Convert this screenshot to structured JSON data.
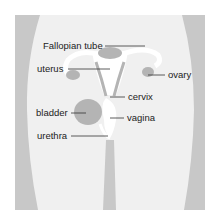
{
  "diagram": {
    "labels": [
      {
        "id": "fallopian_tube",
        "text": "Fallopian tube"
      },
      {
        "id": "uterus",
        "text": "uterus"
      },
      {
        "id": "ovary",
        "text": "ovary"
      },
      {
        "id": "cervix",
        "text": "cervix"
      },
      {
        "id": "bladder",
        "text": "bladder"
      },
      {
        "id": "vagina",
        "text": "vagina"
      },
      {
        "id": "urethra",
        "text": "urethra"
      }
    ],
    "colors": {
      "background": "#ffffff",
      "panel": "#f0f0f0",
      "hip_shading": "#c8c8c8",
      "organ": "#b4b4b4",
      "tube_white": "#ffffff",
      "leader_line": "#333333",
      "text": "#222222"
    }
  }
}
